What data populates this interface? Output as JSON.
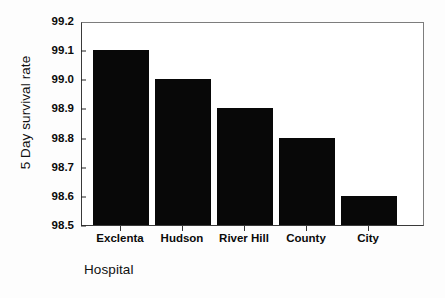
{
  "chart_data": {
    "type": "bar",
    "title": "",
    "xlabel": "Hospital",
    "ylabel": "5 Day survival rate",
    "categories": [
      "Exclenta",
      "Hudson",
      "River Hill",
      "County",
      "City"
    ],
    "values": [
      99.1,
      99.0,
      98.9,
      98.8,
      98.6
    ],
    "ylim": [
      98.5,
      99.2
    ],
    "yticks": [
      "98.5",
      "98.6",
      "98.7",
      "98.8",
      "98.9",
      "99.0",
      "99.1",
      "99.2"
    ],
    "ytick_values": [
      98.5,
      98.6,
      98.7,
      98.8,
      98.9,
      99.0,
      99.1,
      99.2
    ],
    "grid": false,
    "legend": "none",
    "bar_color": "#080808",
    "frame_color": "#3a3a3a",
    "background_color": "#ffffff"
  }
}
